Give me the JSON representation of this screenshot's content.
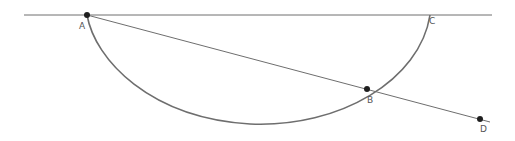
{
  "diagram": {
    "type": "geometry",
    "colors": {
      "line": "#6e6e6e",
      "arc": "#6e6e6e",
      "point": "#1f1f1f",
      "label": "#555555",
      "background": "#ffffff"
    },
    "points": [
      {
        "id": "A",
        "label": "A",
        "x": 87,
        "y": 15,
        "label_x": 79,
        "label_y": 29
      },
      {
        "id": "B",
        "label": "B",
        "x": 367,
        "y": 89,
        "label_x": 367,
        "label_y": 103
      },
      {
        "id": "C",
        "label": "C",
        "x": 430,
        "y": 15,
        "label_x": 429,
        "label_y": 24
      },
      {
        "id": "D",
        "label": "D",
        "x": 480,
        "y": 119,
        "label_x": 480,
        "label_y": 132
      }
    ],
    "horizontal_line": {
      "x1": 24,
      "y1": 15,
      "x2": 492,
      "y2": 15
    },
    "secant_line": {
      "from": "A",
      "through": "B",
      "to": "D",
      "x1": 87,
      "y1": 15,
      "x2": 490,
      "y2": 122
    },
    "arc": {
      "from": "A",
      "to": "C",
      "lowest_y": 124,
      "description": "semicircular arc below line AC passing through B"
    }
  }
}
